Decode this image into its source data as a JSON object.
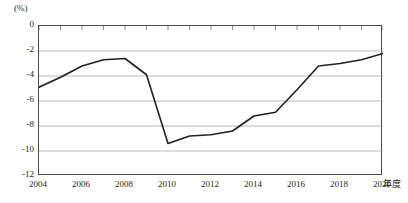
{
  "chart_data": {
    "type": "line",
    "title": "",
    "subtitle": "",
    "unit_label": "(%)",
    "xlabel": "年度",
    "ylabel": "",
    "x": [
      2004,
      2005,
      2006,
      2007,
      2008,
      2009,
      2010,
      2011,
      2012,
      2013,
      2014,
      2015,
      2016,
      2017,
      2018,
      2019,
      2020
    ],
    "values": [
      -4.9,
      -4.1,
      -3.2,
      -2.7,
      -2.6,
      -3.9,
      -9.4,
      -8.8,
      -8.7,
      -8.4,
      -7.2,
      -6.9,
      -5.1,
      -3.2,
      -3.0,
      -2.7,
      -2.2
    ],
    "series": [
      {
        "name": "財政収支対GDP比",
        "values": [
          -4.9,
          -4.1,
          -3.2,
          -2.7,
          -2.6,
          -3.9,
          -9.4,
          -8.8,
          -8.7,
          -8.4,
          -7.2,
          -6.9,
          -5.1,
          -3.2,
          -3.0,
          -2.7,
          -2.2
        ],
        "color": "#231f20"
      }
    ],
    "xlim": [
      2004,
      2020
    ],
    "ylim": [
      -12,
      0
    ],
    "ytick_values": [
      0,
      -2,
      -4,
      -6,
      -8,
      -10,
      -12
    ],
    "ytick_labels": [
      "0",
      "-2",
      "-4",
      "-6",
      "-8",
      "-10",
      "-12"
    ],
    "xtick_values": [
      2004,
      2006,
      2008,
      2010,
      2012,
      2014,
      2016,
      2018,
      2020
    ],
    "xtick_labels": [
      "2004",
      "2006",
      "2008",
      "2010",
      "2012",
      "2014",
      "2016",
      "2018",
      "2020"
    ],
    "minor_xticks": [
      2004,
      2005,
      2006,
      2007,
      2008,
      2009,
      2010,
      2011,
      2012,
      2013,
      2014,
      2015,
      2016,
      2017,
      2018,
      2019,
      2020
    ],
    "grid": "horizontal",
    "legend": "none",
    "line_color": "#231f20",
    "grid_color": "#aaaaaa",
    "frame_color": "#4a4a4a"
  },
  "plot_points": [
    {
      "year": 2004,
      "value": -4.9
    },
    {
      "year": 2005,
      "value": -4.1
    },
    {
      "year": 2006,
      "value": -3.2
    },
    {
      "year": 2007,
      "value": -2.7
    },
    {
      "year": 2008,
      "value": -2.6
    },
    {
      "year": 2009,
      "value": -3.9
    },
    {
      "year": 2010,
      "value": -9.4
    },
    {
      "year": 2011,
      "value": -8.8
    },
    {
      "year": 2012,
      "value": -8.7
    },
    {
      "year": 2013,
      "value": -8.4
    },
    {
      "year": 2014,
      "value": -7.2
    },
    {
      "year": 2015,
      "value": -6.9
    },
    {
      "year": 2016,
      "value": -5.1
    },
    {
      "year": 2017,
      "value": -3.2
    },
    {
      "year": 2018,
      "value": -3.0
    },
    {
      "year": 2019,
      "value": -2.7
    },
    {
      "year": 2020,
      "value": -2.2
    }
  ]
}
